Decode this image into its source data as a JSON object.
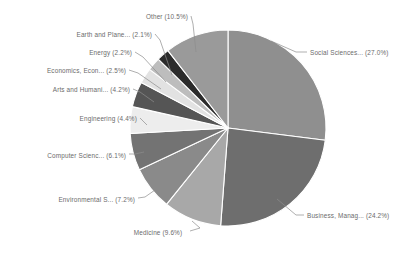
{
  "chart_data": {
    "type": "pie",
    "title": "",
    "subtitle": "",
    "xlabel": "",
    "ylabel": "",
    "legend_position": "none",
    "grid": false,
    "start_angle_deg": 90,
    "direction": "clockwise",
    "value_unit": "percent",
    "categories": [
      "Social Sciences...",
      "Business, Manag...",
      "Medicine",
      "Environmental S...",
      "Computer Scienc...",
      "Engineering",
      "Arts and Humani...",
      "Economics, Econ...",
      "Energy",
      "Earth and Plane...",
      "Other"
    ],
    "values": [
      27.0,
      24.2,
      9.6,
      7.2,
      6.1,
      4.4,
      4.2,
      2.5,
      2.2,
      2.1,
      10.5
    ],
    "colors": [
      "#8f8f8f",
      "#6e6e6e",
      "#a8a8a8",
      "#8a8a8a",
      "#737373",
      "#ededed",
      "#555555",
      "#e2e2e2",
      "#bdbdbd",
      "#2b2b2b",
      "#9a9a9a"
    ],
    "slices": [
      {
        "name": "Social Sciences...",
        "value": 27.0,
        "label": "Social Sciences... (27.0%)",
        "color": "#8f8f8f",
        "label_x": 310,
        "label_y": 55,
        "anchor": "start",
        "leader": "M 271 41 L 296 52 L 307 52"
      },
      {
        "name": "Business, Manag...",
        "value": 24.2,
        "label": "Business, Manag... (24.2%)",
        "color": "#6e6e6e",
        "label_x": 307,
        "label_y": 218,
        "anchor": "start",
        "leader": "M 277 199 L 296 215 L 304 215"
      },
      {
        "name": "Medicine",
        "value": 9.6,
        "label": "Medicine (9.6%)",
        "color": "#a8a8a8",
        "label_x": 158,
        "label_y": 235,
        "anchor": "middle",
        "leader": "M 192 221 L 200 228 L 190 231"
      },
      {
        "name": "Environmental S...",
        "value": 7.2,
        "label": "Environmental S... (7.2%)",
        "color": "#8a8a8a",
        "label_x": 135,
        "label_y": 202,
        "anchor": "end",
        "leader": "M 155 190 L 145 197 L 138 198"
      },
      {
        "name": "Computer Scienc...",
        "value": 6.1,
        "label": "Computer Scienc... (6.1%)",
        "color": "#737373",
        "label_x": 126,
        "label_y": 158,
        "anchor": "end",
        "leader": "M 144 152 L 135 154 L 129 154"
      },
      {
        "name": "Engineering",
        "value": 4.4,
        "label": "Engineering (4.4%)",
        "color": "#ededed",
        "label_x": 137,
        "label_y": 121,
        "anchor": "end",
        "leader": "M 147 125 L 143 121 L 140 118"
      },
      {
        "name": "Arts and Humani...",
        "value": 4.2,
        "label": "Arts and Humani... (4.2%)",
        "color": "#555555",
        "label_x": 130,
        "label_y": 92,
        "anchor": "end",
        "leader": "M 154 102 L 140 92 L 133 89"
      },
      {
        "name": "Economics, Econ...",
        "value": 2.5,
        "label": "Economics, Econ... (2.5%)",
        "color": "#e2e2e2",
        "label_x": 126,
        "label_y": 73,
        "anchor": "end",
        "leader": "M 161 89 L 138 73 L 129 70"
      },
      {
        "name": "Energy",
        "value": 2.2,
        "label": "Energy (2.2%)",
        "color": "#bdbdbd",
        "label_x": 132,
        "label_y": 55,
        "anchor": "end",
        "leader": "M 166 82 L 143 57 L 135 52"
      },
      {
        "name": "Earth and Plane...",
        "value": 2.1,
        "label": "Earth and Plane... (2.1%)",
        "color": "#2b2b2b",
        "label_x": 152,
        "label_y": 37,
        "anchor": "end",
        "leader": "M 172 75 L 160 40 L 155 34"
      },
      {
        "name": "Other",
        "value": 10.5,
        "label": "Other (10.5%)",
        "color": "#9a9a9a",
        "label_x": 188,
        "label_y": 19,
        "anchor": "end",
        "leader": "M 196 52 L 193 24 L 191 16"
      }
    ],
    "geometry": {
      "cx": 228,
      "cy": 128,
      "r": 98
    },
    "background_color": "#ffffff",
    "label_color": "#6b6b6b",
    "slice_border_color": "#ffffff"
  }
}
